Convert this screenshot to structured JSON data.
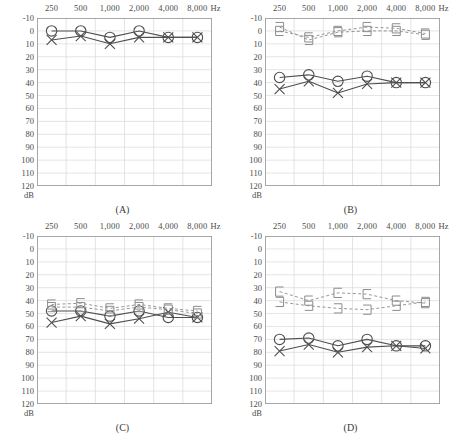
{
  "figure": {
    "type": "audiogram-grid",
    "panel_count": 4,
    "colors": {
      "grid": "#d9d9d9",
      "border": "#9a9a9a",
      "air_right": "#4f4f4f",
      "air_left": "#4f4f4f",
      "bone": "#8c8c8c",
      "text": "#3a3a3a"
    }
  },
  "axes": {
    "x_unit": "Hz",
    "x_label_unit_text": "Hz",
    "x_ticks": [
      "250",
      "500",
      "1,000",
      "2,000",
      "4,000",
      "8,000"
    ],
    "x_values": [
      250,
      500,
      1000,
      2000,
      4000,
      8000
    ],
    "y_label": "dB",
    "y_ticks": [
      "-10",
      "0",
      "10",
      "20",
      "30",
      "40",
      "50",
      "60",
      "70",
      "80",
      "90",
      "100",
      "110",
      "120"
    ],
    "y_values": [
      -10,
      0,
      10,
      20,
      30,
      40,
      50,
      60,
      70,
      80,
      90,
      100,
      110,
      120
    ],
    "y_min": -10,
    "y_max": 120,
    "grid": true,
    "x_axis_position": "top",
    "y_direction": "inverted"
  },
  "legend": {
    "air_right_symbol": "circle",
    "air_left_symbol": "x",
    "bone_right_symbol": "bracket-left",
    "bone_left_symbol": "bracket-right"
  },
  "chart_data": [
    {
      "id": "A",
      "type": "line",
      "title": "(A)",
      "xlabel": "Hz",
      "ylabel": "dB",
      "categories": [
        "250",
        "500",
        "1,000",
        "2,000",
        "4,000",
        "8,000"
      ],
      "x": [
        250,
        500,
        1000,
        2000,
        4000,
        8000
      ],
      "ylim": [
        -10,
        120
      ],
      "grid": true,
      "series": [
        {
          "name": "Air conduction right",
          "symbol": "circle",
          "values": [
            0,
            0,
            5,
            0,
            5,
            5
          ]
        },
        {
          "name": "Air conduction left",
          "symbol": "x",
          "values": [
            7,
            4,
            10,
            5,
            5,
            5
          ]
        }
      ]
    },
    {
      "id": "B",
      "type": "line",
      "title": "(B)",
      "xlabel": "Hz",
      "ylabel": "dB",
      "categories": [
        "250",
        "500",
        "1,000",
        "2,000",
        "4,000",
        "8,000"
      ],
      "x": [
        250,
        500,
        1000,
        2000,
        4000,
        8000
      ],
      "ylim": [
        -10,
        120
      ],
      "grid": true,
      "series": [
        {
          "name": "Air conduction right",
          "symbol": "circle",
          "values": [
            36,
            34,
            39,
            35,
            40,
            40
          ]
        },
        {
          "name": "Air conduction left",
          "symbol": "x",
          "values": [
            45,
            39,
            48,
            41,
            40,
            40
          ]
        },
        {
          "name": "Bone conduction right",
          "symbol": "bracket-left",
          "values": [
            0,
            5,
            0,
            -3,
            -2,
            2
          ]
        },
        {
          "name": "Bone conduction left",
          "symbol": "bracket-right",
          "values": [
            -3,
            7,
            1,
            0,
            0,
            3
          ]
        }
      ]
    },
    {
      "id": "C",
      "type": "line",
      "title": "(C)",
      "xlabel": "Hz",
      "ylabel": "dB",
      "categories": [
        "250",
        "500",
        "1,000",
        "2,000",
        "4,000",
        "8,000"
      ],
      "x": [
        250,
        500,
        1000,
        2000,
        4000,
        8000
      ],
      "ylim": [
        -10,
        120
      ],
      "grid": true,
      "series": [
        {
          "name": "Air conduction right",
          "symbol": "circle",
          "values": [
            48,
            48,
            52,
            48,
            53,
            53
          ]
        },
        {
          "name": "Air conduction left",
          "symbol": "x",
          "values": [
            57,
            52,
            58,
            54,
            49,
            53
          ]
        },
        {
          "name": "Bone conduction right",
          "symbol": "bracket-left",
          "values": [
            43,
            42,
            46,
            43,
            46,
            48
          ]
        },
        {
          "name": "Bone conduction left",
          "symbol": "bracket-right",
          "values": [
            45,
            45,
            48,
            45,
            47,
            50
          ]
        }
      ]
    },
    {
      "id": "D",
      "type": "line",
      "title": "(D)",
      "xlabel": "Hz",
      "ylabel": "dB",
      "categories": [
        "250",
        "500",
        "1,000",
        "2,000",
        "4,000",
        "8,000"
      ],
      "x": [
        250,
        500,
        1000,
        2000,
        4000,
        8000
      ],
      "ylim": [
        -10,
        120
      ],
      "grid": true,
      "series": [
        {
          "name": "Air conduction right",
          "symbol": "circle",
          "values": [
            70,
            69,
            75,
            70,
            75,
            75
          ]
        },
        {
          "name": "Air conduction left",
          "symbol": "x",
          "values": [
            79,
            74,
            80,
            76,
            75,
            77
          ]
        },
        {
          "name": "Bone conduction right",
          "symbol": "bracket-left",
          "values": [
            33,
            40,
            34,
            35,
            40,
            42
          ]
        },
        {
          "name": "Bone conduction left",
          "symbol": "bracket-right",
          "values": [
            41,
            44,
            46,
            47,
            44,
            41
          ]
        }
      ]
    }
  ],
  "panels": [
    {
      "key": "A",
      "caption": "(A)"
    },
    {
      "key": "B",
      "caption": "(B)"
    },
    {
      "key": "C",
      "caption": "(C)"
    },
    {
      "key": "D",
      "caption": "(D)"
    }
  ]
}
